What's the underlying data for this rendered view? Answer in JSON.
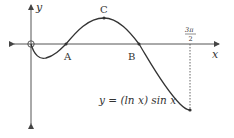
{
  "diagram": {
    "equation": "y = (ln x) sin x",
    "axes": {
      "x_label": "x",
      "y_label": "y"
    },
    "points": [
      {
        "label": "A",
        "description": "x-intercept (x = 1)"
      },
      {
        "label": "C",
        "description": "local maximum"
      },
      {
        "label": "B",
        "description": "x-intercept (x = π)"
      }
    ],
    "end_marker": {
      "numerator": "3π",
      "denominator": "2"
    },
    "colors": {
      "curve": "#333333",
      "axes": "#555555"
    }
  }
}
